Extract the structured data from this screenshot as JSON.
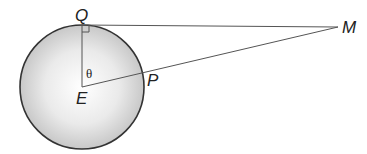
{
  "diagram": {
    "type": "geometry",
    "points": {
      "E": {
        "label": "E",
        "x": 82,
        "y": 87
      },
      "Q": {
        "label": "Q",
        "x": 82,
        "y": 25
      },
      "P": {
        "label": "P",
        "x": 142,
        "y": 71
      },
      "M": {
        "label": "M",
        "x": 338,
        "y": 27
      }
    },
    "angle_label": "θ",
    "right_angle_at": "Q",
    "circle": {
      "cx": 82,
      "cy": 87,
      "r": 62,
      "fill_center": "#ffffff",
      "fill_edge": "#c8c8c8",
      "stroke": "#333333"
    },
    "line_color": "#555555"
  }
}
